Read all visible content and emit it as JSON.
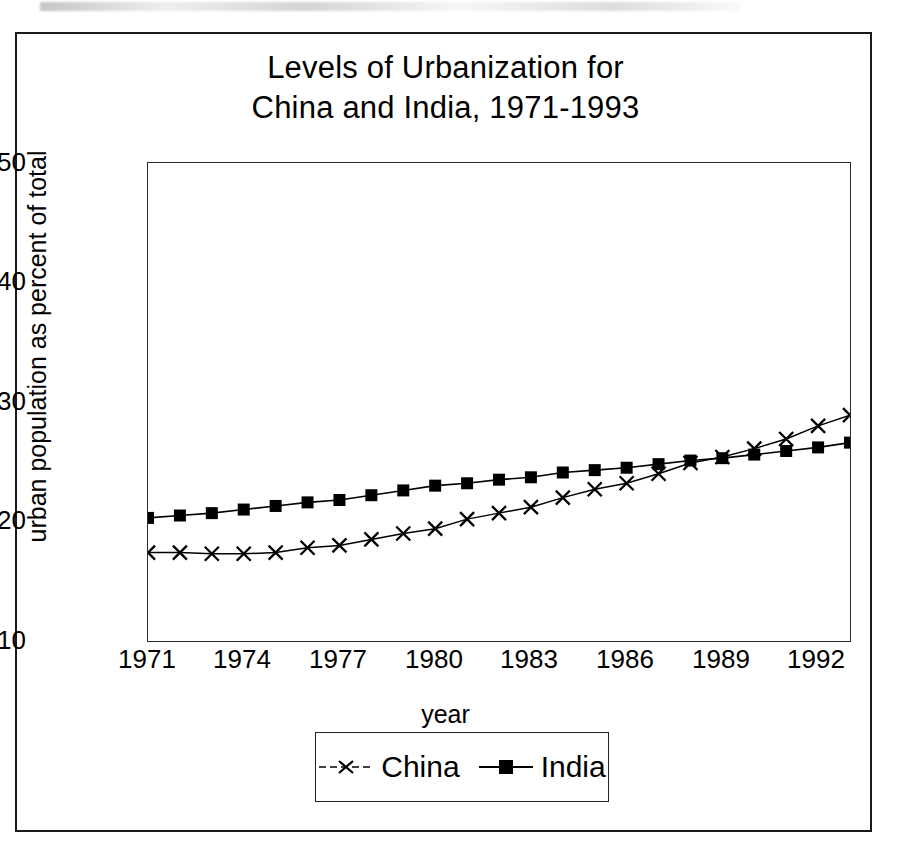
{
  "figure": {
    "title_line1": "Levels of Urbanization for",
    "title_line2": "China and India, 1971-1993",
    "ink_color": "#000000",
    "background_color": "#ffffff"
  },
  "axes": {
    "y_title": "urban population as percent of total",
    "x_title": "year",
    "y_ticks": [
      "10",
      "20",
      "30",
      "40",
      "50"
    ],
    "x_ticks": [
      "1971",
      "1974",
      "1977",
      "1980",
      "1983",
      "1986",
      "1989",
      "1992"
    ]
  },
  "legend": {
    "position": "below-plot",
    "entries": [
      {
        "label": "China",
        "marker": "x-cross-marker"
      },
      {
        "label": "India",
        "marker": "filled-square-marker"
      }
    ]
  },
  "chart_data": {
    "type": "line",
    "title": "Levels of Urbanization for China and India, 1971-1993",
    "xlabel": "year",
    "ylabel": "urban population as percent of total",
    "xlim": [
      1971,
      1993
    ],
    "ylim": [
      10,
      50
    ],
    "ytick_values": [
      10,
      20,
      30,
      40,
      50
    ],
    "xtick_values": [
      1971,
      1974,
      1977,
      1980,
      1983,
      1986,
      1989,
      1992
    ],
    "grid": false,
    "legend_position": "below",
    "x": [
      1971,
      1972,
      1973,
      1974,
      1975,
      1976,
      1977,
      1978,
      1979,
      1980,
      1981,
      1982,
      1983,
      1984,
      1985,
      1986,
      1987,
      1988,
      1989,
      1990,
      1991,
      1992,
      1993
    ],
    "series": [
      {
        "name": "China",
        "marker": "x",
        "values": [
          17.4,
          17.4,
          17.3,
          17.3,
          17.4,
          17.8,
          18.0,
          18.5,
          19.0,
          19.4,
          20.2,
          20.7,
          21.2,
          22.0,
          22.7,
          23.2,
          24.0,
          24.9,
          25.4,
          26.1,
          26.9,
          28.0,
          28.9
        ]
      },
      {
        "name": "India",
        "marker": "square",
        "values": [
          20.3,
          20.5,
          20.7,
          21.0,
          21.3,
          21.6,
          21.8,
          22.2,
          22.6,
          23.0,
          23.2,
          23.5,
          23.7,
          24.1,
          24.3,
          24.5,
          24.8,
          25.1,
          25.3,
          25.6,
          25.9,
          26.2,
          26.6
        ]
      }
    ],
    "annotations": [
      "China's urban share is flat near 17.4 percent from 1971 to 1975, then rises steadily",
      "The two series cross near 1988-1989 at about 25 percent"
    ]
  }
}
